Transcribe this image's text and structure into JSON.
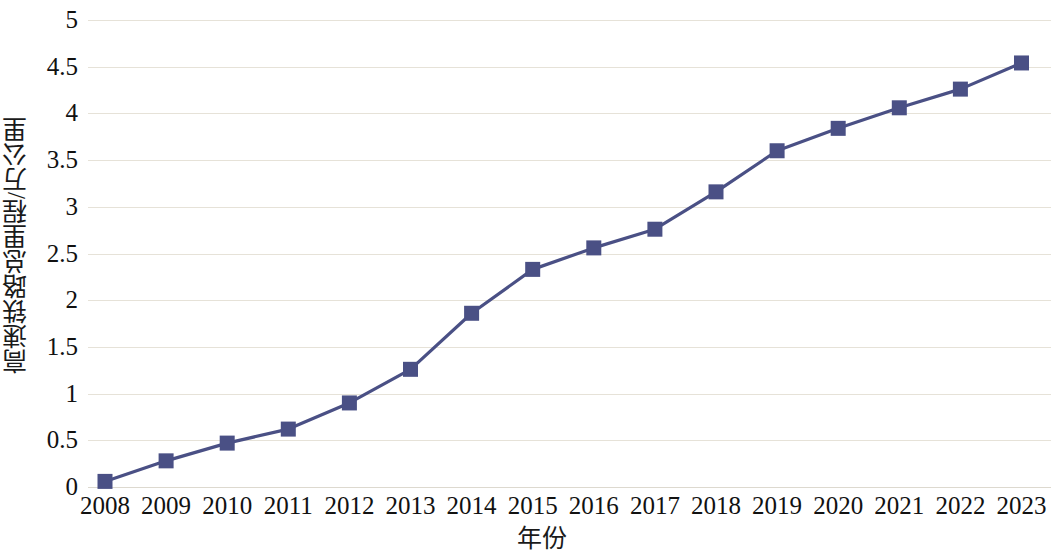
{
  "chart_data": {
    "type": "line",
    "title": "",
    "xlabel": "年份",
    "ylabel": "高速铁路总里程/万公里",
    "categories": [
      "2008",
      "2009",
      "2010",
      "2011",
      "2012",
      "2013",
      "2014",
      "2015",
      "2016",
      "2017",
      "2018",
      "2019",
      "2020",
      "2021",
      "2022",
      "2023"
    ],
    "values": [
      0.06,
      0.28,
      0.47,
      0.62,
      0.9,
      1.26,
      1.86,
      2.33,
      2.56,
      2.76,
      3.16,
      3.6,
      3.84,
      4.06,
      4.26,
      4.54
    ],
    "series": [
      {
        "name": "高速铁路总里程",
        "values": [
          0.06,
          0.28,
          0.47,
          0.62,
          0.9,
          1.26,
          1.86,
          2.33,
          2.56,
          2.76,
          3.16,
          3.6,
          3.84,
          4.06,
          4.26,
          4.54
        ]
      }
    ],
    "ylim": [
      0,
      5
    ],
    "ytick_labels": [
      "0",
      "0.5",
      "1",
      "1.5",
      "2",
      "2.5",
      "3",
      "3.5",
      "4",
      "4.5",
      "5"
    ],
    "ytick_values": [
      0,
      0.5,
      1,
      1.5,
      2,
      2.5,
      3,
      3.5,
      4,
      4.5,
      5
    ],
    "grid": true,
    "legend": "none",
    "marker": "square",
    "line_color": "#4a5085",
    "marker_color": "#4a5085",
    "grid_color": "#e6e2d8",
    "background_color": "#ffffff"
  }
}
